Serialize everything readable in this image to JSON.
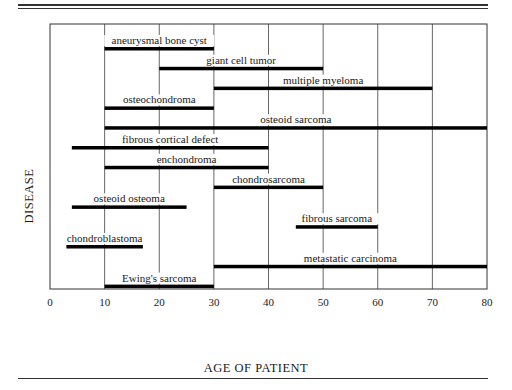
{
  "chart_data": {
    "type": "bar",
    "subtype": "horizontal-range",
    "title": "",
    "xlabel": "AGE OF PATIENT",
    "ylabel": "DISEASE",
    "xlim": [
      0,
      80
    ],
    "xticks": [
      0,
      10,
      20,
      30,
      40,
      50,
      60,
      70,
      80
    ],
    "grid": "vertical lines at decade ticks (partially interrupted by labels)",
    "legend": "none",
    "series": [
      {
        "name": "aneurysmal bone cyst",
        "start": 10,
        "end": 30
      },
      {
        "name": "giant cell tumor",
        "start": 20,
        "end": 50
      },
      {
        "name": "multiple myeloma",
        "start": 30,
        "end": 70
      },
      {
        "name": "osteochondroma",
        "start": 10,
        "end": 30
      },
      {
        "name": "osteoid sarcoma",
        "start": 10,
        "end": 80
      },
      {
        "name": "fibrous cortical defect",
        "start": 4,
        "end": 40
      },
      {
        "name": "enchondroma",
        "start": 10,
        "end": 40
      },
      {
        "name": "chondrosarcoma",
        "start": 30,
        "end": 50
      },
      {
        "name": "osteoid osteoma",
        "start": 4,
        "end": 25
      },
      {
        "name": "fibrous sarcoma",
        "start": 45,
        "end": 60
      },
      {
        "name": "chondroblastoma",
        "start": 3,
        "end": 17
      },
      {
        "name": "metastatic carcinoma",
        "start": 30,
        "end": 80
      },
      {
        "name": "Ewing's sarcoma",
        "start": 10,
        "end": 30
      }
    ]
  },
  "colors": {
    "bar": "#000000",
    "grid": "#555555",
    "frame": "#333333"
  }
}
